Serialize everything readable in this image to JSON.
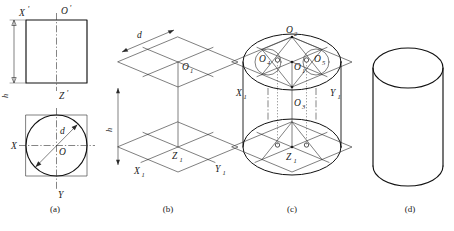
{
  "figure": {
    "width": 454,
    "height": 231,
    "background": "#ffffff",
    "line_color": "#111111",
    "thin_line_color": "#3a3a3a"
  },
  "captions": [
    {
      "key": "a",
      "text": "(a)",
      "x": 55,
      "y": 212
    },
    {
      "key": "b",
      "text": "(b)",
      "x": 168,
      "y": 212
    },
    {
      "key": "c",
      "text": "(c)",
      "x": 292,
      "y": 212
    },
    {
      "key": "d",
      "text": "(d)",
      "x": 410,
      "y": 212
    }
  ],
  "panel_a": {
    "name": "orthographic-views",
    "front_view": {
      "label": "front-view-rectangle",
      "labels": {
        "x_axis": "X",
        "x_prime": "'",
        "o_axis": "O",
        "o_prime": "'",
        "z_axis": "Z",
        "z_prime": "'"
      }
    },
    "top_view": {
      "label": "top-view-circle-in-square",
      "labels": {
        "x_axis": "X",
        "o_origin": "O",
        "y_axis": "Y",
        "diameter": "d"
      }
    },
    "dimension_height": "h"
  },
  "panel_b": {
    "name": "isometric-axes-rhombi",
    "labels": {
      "diameter": "d",
      "height": "h",
      "top_center": "O",
      "top_center_sub": "1",
      "bottom_center": "Z",
      "bottom_center_sub": "1",
      "x_axis": "X",
      "x_axis_sub": "1",
      "y_axis": "Y",
      "y_axis_sub": "1"
    }
  },
  "panel_c": {
    "name": "four-center-ellipse-construction",
    "labels": {
      "apex_center": "O",
      "apex_center_sub": "2",
      "left_center": "O",
      "left_center_sub": "4",
      "mid_center": "O",
      "mid_center_sub": "1",
      "right_center": "O",
      "right_center_sub": "5",
      "lower_center": "O",
      "lower_center_sub": "3",
      "bottom_center": "Z",
      "bottom_center_sub": "1",
      "x_axis": "X",
      "x_axis_sub": "1",
      "y_axis": "Y",
      "y_axis_sub": "1"
    }
  },
  "panel_d": {
    "name": "finished-cylinder",
    "description": "cylinder"
  }
}
